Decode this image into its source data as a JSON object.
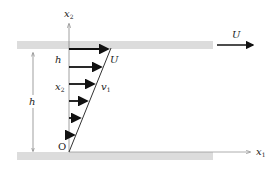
{
  "diagram": {
    "labels": {
      "x2_axis": "x",
      "x2_axis_sub": "2",
      "x1_axis": "x",
      "x1_axis_sub": "1",
      "plate_velocity": "U",
      "profile_top": "U",
      "height_inner": "h",
      "height_dim": "h",
      "position": "x",
      "position_sub": "2",
      "velocity": "v",
      "velocity_sub": "1",
      "origin": "O"
    },
    "colors": {
      "plate": "#d9d9d9",
      "line": "#333333",
      "arrow": "#111111",
      "axis": "#888888"
    },
    "arrows": [
      {
        "y": 49,
        "x_end": 110
      },
      {
        "y": 67,
        "x_end": 103
      },
      {
        "y": 84,
        "x_end": 96
      },
      {
        "y": 101,
        "x_end": 89
      },
      {
        "y": 118,
        "x_end": 82
      },
      {
        "y": 135,
        "x_end": 76
      }
    ]
  }
}
